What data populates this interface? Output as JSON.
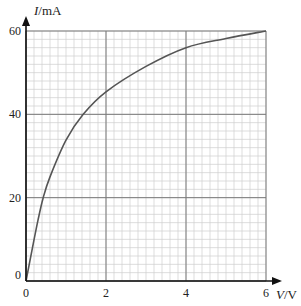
{
  "chart_data": {
    "type": "line",
    "title": "",
    "xlabel": "V/V",
    "ylabel": "I/mA",
    "xlabel_parts": {
      "var": "V",
      "unit": "/V"
    },
    "ylabel_parts": {
      "var": "I",
      "unit": "/mA"
    },
    "xlim": [
      0,
      6
    ],
    "ylim": [
      0,
      60
    ],
    "x_ticks": [
      "0",
      "2",
      "4",
      "6"
    ],
    "y_ticks": [
      "0",
      "20",
      "40",
      "60"
    ],
    "grid": {
      "on": true,
      "major_x_step": 2,
      "major_y_step": 20,
      "minor_x_step": 0.2,
      "minor_y_step": 2
    },
    "legend": null,
    "series": [
      {
        "name": "I-V characteristic",
        "x": [
          0,
          0.15,
          0.3,
          0.43,
          0.6,
          1.0,
          1.43,
          2.0,
          3.0,
          4.0,
          5.0,
          6.0
        ],
        "y": [
          0,
          7.4,
          14.6,
          20,
          25,
          33.8,
          40,
          45.4,
          51.5,
          56,
          58.2,
          60
        ]
      }
    ]
  },
  "colors": {
    "major_grid": "#7a7a7a",
    "minor_grid": "#cfcfcf",
    "axis": "#111111",
    "curve": "#555555"
  }
}
